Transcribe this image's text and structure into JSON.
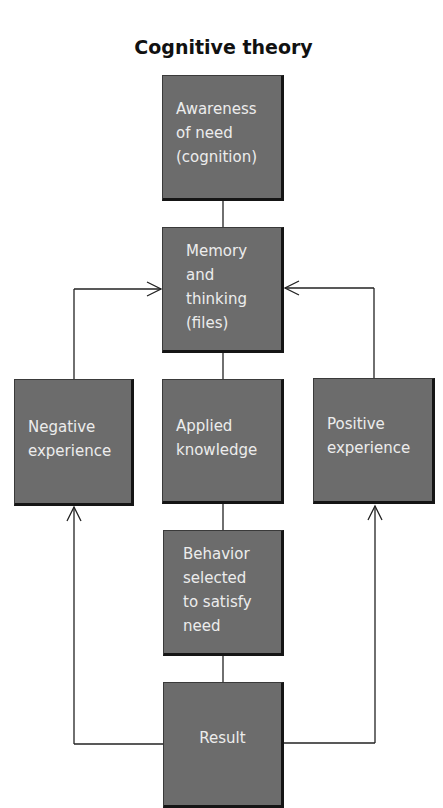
{
  "diagram": {
    "title": "Cognitive theory",
    "colors": {
      "box_fill": "#6c6c6c",
      "box_shadow": "#151515",
      "box_text": "#ececec",
      "line": "#222222",
      "title": "#111111"
    },
    "nodes": {
      "awareness": {
        "lines": [
          "Awareness",
          "of need",
          "(cognition)"
        ]
      },
      "memory": {
        "lines": [
          "Memory",
          "and",
          "thinking",
          "(files)"
        ]
      },
      "negative": {
        "lines": [
          "Negative",
          "experience"
        ]
      },
      "applied": {
        "lines": [
          "Applied",
          "knowledge"
        ]
      },
      "positive": {
        "lines": [
          "Positive",
          "experience"
        ]
      },
      "behavior": {
        "lines": [
          "Behavior",
          "selected",
          "to satisfy",
          "need"
        ]
      },
      "result": {
        "lines": [
          "Result"
        ]
      }
    },
    "edges": [
      {
        "from": "Awareness of need (cognition)",
        "to": "Memory and thinking (files)",
        "arrow": false
      },
      {
        "from": "Memory and thinking (files)",
        "to": "Applied knowledge",
        "arrow": false
      },
      {
        "from": "Applied knowledge",
        "to": "Behavior selected to satisfy need",
        "arrow": false
      },
      {
        "from": "Behavior selected to satisfy need",
        "to": "Result",
        "arrow": false
      },
      {
        "from": "Result",
        "to": "Negative experience",
        "arrow": true
      },
      {
        "from": "Result",
        "to": "Positive experience",
        "arrow": true
      },
      {
        "from": "Negative experience",
        "to": "Memory and thinking (files)",
        "arrow": true
      },
      {
        "from": "Positive experience",
        "to": "Memory and thinking (files)",
        "arrow": true
      }
    ]
  }
}
